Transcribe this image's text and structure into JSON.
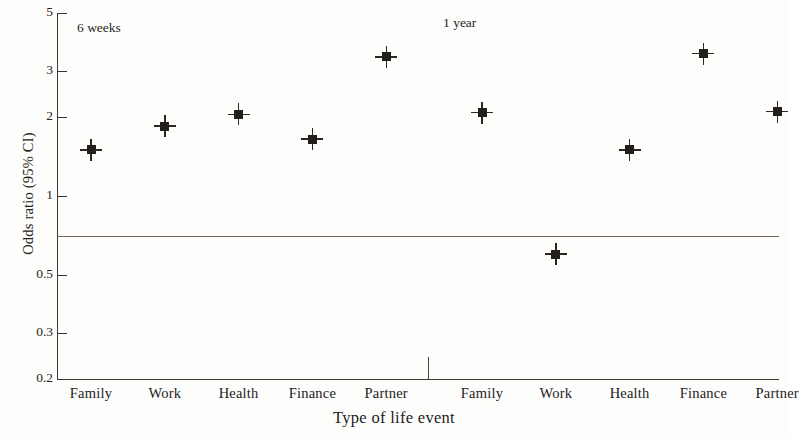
{
  "chart_data": {
    "type": "scatter",
    "title": "",
    "xlabel": "Type of life event",
    "ylabel": "Odds ratio (95% CI)",
    "yscale": "log",
    "ylim": [
      0.2,
      5
    ],
    "yticks": [
      5,
      3,
      2,
      1,
      0.5,
      0.3,
      0.2
    ],
    "ytick_labels": [
      "5",
      "3",
      "2",
      "1",
      "0.5",
      "0.3",
      "0.2"
    ],
    "grid": false,
    "legend": "none",
    "reference_line": 1,
    "panels": [
      {
        "label": "6 weeks",
        "categories": [
          "Family",
          "Work",
          "Health",
          "Finance",
          "Partner"
        ],
        "values": [
          1.5,
          1.85,
          2.05,
          1.65,
          3.4
        ]
      },
      {
        "label": "1 year",
        "categories": [
          "Family",
          "Work",
          "Health",
          "Finance",
          "Partner"
        ],
        "values": [
          2.08,
          0.6,
          1.5,
          3.5,
          2.1
        ]
      }
    ],
    "categories": [
      "Family",
      "Work",
      "Health",
      "Finance",
      "Partner",
      "Family",
      "Work",
      "Health",
      "Finance",
      "Partner"
    ],
    "values": [
      1.5,
      1.85,
      2.05,
      1.65,
      3.4,
      2.08,
      0.6,
      1.5,
      3.5,
      2.1
    ],
    "marker": "square-with-error-bars",
    "marker_color": "#241f1a",
    "axis_color": "#3b3833",
    "reference_line_color": "#7a6a5c"
  },
  "axis": {
    "y_title": "Odds ratio (95% CI)",
    "x_title": "Type of life event",
    "y_ticks": [
      {
        "label": "5",
        "value": 5
      },
      {
        "label": "3",
        "value": 3
      },
      {
        "label": "2",
        "value": 2
      },
      {
        "label": "1",
        "value": 1
      },
      {
        "label": "0.5",
        "value": 0.5
      },
      {
        "label": "0.3",
        "value": 0.3
      },
      {
        "label": "0.2",
        "value": 0.2
      }
    ],
    "x_ticks": [
      {
        "label": "Family"
      },
      {
        "label": "Work"
      },
      {
        "label": "Health"
      },
      {
        "label": "Finance"
      },
      {
        "label": "Partner"
      },
      {
        "label": "Family"
      },
      {
        "label": "Work"
      },
      {
        "label": "Health"
      },
      {
        "label": "Finance"
      },
      {
        "label": "Partner"
      }
    ]
  },
  "annotations": {
    "panel_left": "6 weeks",
    "panel_right": "1 year"
  }
}
